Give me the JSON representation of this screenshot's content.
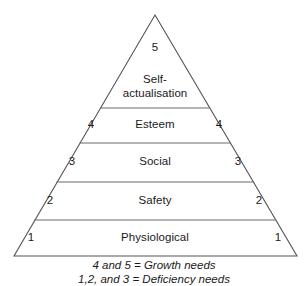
{
  "diagram": {
    "type": "pyramid",
    "shape_name": "triangle-pyramid",
    "colors": {
      "background": "#ffffff",
      "outline": "#555558",
      "divider": "#6b6b70",
      "text": "#1a1a1a"
    },
    "apex": {
      "level_number": "5",
      "label": "Self-\nactualisation",
      "label_line_1": "Self-",
      "label_line_2": "actualisation"
    },
    "tiers": [
      {
        "level_number": "5",
        "label": "Self-actualisation",
        "left_number": "",
        "right_number": "",
        "group": "growth"
      },
      {
        "level_number": "4",
        "label": "Esteem",
        "left_number": "4",
        "right_number": "4",
        "group": "growth"
      },
      {
        "level_number": "3",
        "label": "Social",
        "left_number": "3",
        "right_number": "3",
        "group": "deficiency"
      },
      {
        "level_number": "2",
        "label": "Safety",
        "left_number": "2",
        "right_number": "2",
        "group": "deficiency"
      },
      {
        "level_number": "1",
        "label": "Physiological",
        "left_number": "1",
        "right_number": "1",
        "group": "deficiency"
      }
    ],
    "caption": {
      "line_1": "4 and 5 = Growth needs",
      "line_2": "1,2, and 3 = Deficiency needs"
    }
  }
}
